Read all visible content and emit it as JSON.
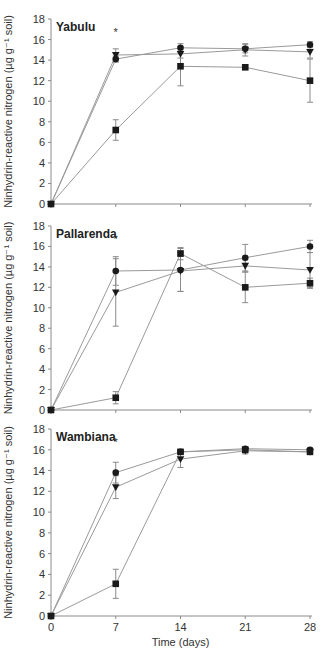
{
  "chart_data": [
    {
      "type": "line",
      "title": "Yabulu",
      "xlabel": "",
      "ylabel": "Ninhydrin-reactive nitrogen (µg g⁻¹ soil)",
      "x": [
        0,
        7,
        14,
        21,
        28
      ],
      "xticks": [
        "0",
        "7",
        "14",
        "21",
        "28"
      ],
      "ylim": [
        0,
        18
      ],
      "yticks": [
        0,
        2,
        4,
        6,
        8,
        10,
        12,
        14,
        16,
        18
      ],
      "annotations": [
        {
          "text": "*",
          "x": 7
        }
      ],
      "series": [
        {
          "name": "circle",
          "marker": "circle",
          "values": [
            0,
            14.1,
            15.2,
            15.1,
            15.5
          ],
          "err": [
            0,
            0.3,
            0.4,
            0.4,
            0.3
          ]
        },
        {
          "name": "triangle",
          "marker": "triangle-down",
          "values": [
            0,
            14.5,
            14.6,
            15.0,
            14.8
          ],
          "err": [
            0,
            0.6,
            0.4,
            0.6,
            0.6
          ]
        },
        {
          "name": "square",
          "marker": "square",
          "values": [
            0,
            7.2,
            13.4,
            13.3,
            12.0
          ],
          "err": [
            0,
            1.0,
            1.9,
            0.2,
            2.1
          ]
        }
      ]
    },
    {
      "type": "line",
      "title": "Pallarenda",
      "xlabel": "",
      "ylabel": "Ninhydrin-reactive nitrogen (µg g⁻¹ soil)",
      "x": [
        0,
        7,
        14,
        21,
        28
      ],
      "xticks": [
        "0",
        "7",
        "14",
        "21",
        "28"
      ],
      "ylim": [
        0,
        18
      ],
      "yticks": [
        0,
        2,
        4,
        6,
        8,
        10,
        12,
        14,
        16,
        18
      ],
      "annotations": [
        {
          "text": "*",
          "x": 7
        }
      ],
      "series": [
        {
          "name": "circle",
          "marker": "circle",
          "values": [
            0,
            13.6,
            13.7,
            14.9,
            16.0
          ],
          "err": [
            0,
            1.4,
            2.1,
            1.3,
            0.6
          ]
        },
        {
          "name": "triangle",
          "marker": "triangle-down",
          "values": [
            0,
            11.5,
            13.6,
            14.1,
            13.7
          ],
          "err": [
            0,
            3.3,
            2.0,
            0.6,
            1.7
          ]
        },
        {
          "name": "square",
          "marker": "square",
          "values": [
            0,
            1.2,
            15.3,
            12.0,
            12.4
          ],
          "err": [
            0,
            0.6,
            0.6,
            1.5,
            0.5
          ]
        }
      ]
    },
    {
      "type": "line",
      "title": "Wambiana",
      "xlabel": "Time (days)",
      "ylabel": "Ninhydrin-reactive nitrogen (µg g⁻¹ soil)",
      "x": [
        0,
        7,
        14,
        21,
        28
      ],
      "xticks": [
        "0",
        "7",
        "14",
        "21",
        "28"
      ],
      "ylim": [
        0,
        18
      ],
      "yticks": [
        0,
        2,
        4,
        6,
        8,
        10,
        12,
        14,
        16,
        18
      ],
      "annotations": [
        {
          "text": "*",
          "x": 7
        }
      ],
      "series": [
        {
          "name": "circle",
          "marker": "circle",
          "values": [
            0,
            13.8,
            15.8,
            16.1,
            16.0
          ],
          "err": [
            0,
            1.0,
            0.2,
            0.2,
            0.2
          ]
        },
        {
          "name": "triangle",
          "marker": "triangle-down",
          "values": [
            0,
            12.4,
            15.1,
            15.9,
            15.8
          ],
          "err": [
            0,
            1.1,
            0.8,
            0.3,
            0.2
          ]
        },
        {
          "name": "square",
          "marker": "square",
          "values": [
            0,
            3.1,
            15.8,
            16.0,
            15.8
          ],
          "err": [
            0,
            1.4,
            0.2,
            0.3,
            0.2
          ]
        }
      ]
    }
  ],
  "style": {
    "line_color": "#9a9a9a",
    "marker_color": "#1a1a1a",
    "axis_color": "#8a8a8a",
    "text_color": "#333333"
  }
}
